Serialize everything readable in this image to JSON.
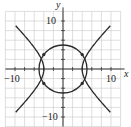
{
  "chart_data": {
    "type": "line",
    "title": "",
    "xlabel": "x",
    "ylabel": "y",
    "xlim": [
      -12,
      12
    ],
    "ylim": [
      -12,
      12
    ],
    "grid": true,
    "grid_step": 2,
    "tick_labels": {
      "x": [
        "-10",
        "10"
      ],
      "y": [
        "10",
        "-10"
      ]
    },
    "series": [
      {
        "name": "circle",
        "equation": "x^2 + y^2 = 25",
        "radius": 5,
        "center": [
          0,
          0
        ]
      },
      {
        "name": "hyperbola",
        "equation": "x^2 - y^2 = 16",
        "vertices": [
          [
            -4,
            0
          ],
          [
            4,
            0
          ]
        ],
        "arrows": true
      }
    ],
    "intersections": [
      [
        -4,
        3
      ],
      [
        -4,
        -3
      ],
      [
        4,
        3
      ],
      [
        4,
        -3
      ]
    ],
    "colors": {
      "curve": "#2a2a2a",
      "grid": "#c8c8c8",
      "axis": "#333333"
    }
  },
  "labels": {
    "x_axis": "x",
    "y_axis": "y",
    "x_neg": "−10",
    "x_pos": "10",
    "y_pos": "10",
    "y_neg": "−10"
  }
}
